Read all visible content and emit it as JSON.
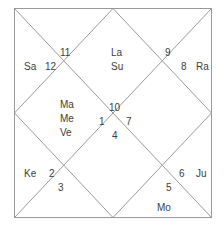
{
  "chart": {
    "type": "north-indian-vedic-birth-chart",
    "frame": {
      "border_color": "#9a9a9a",
      "line_color": "#9a9a9a",
      "background": "#ffffff",
      "text_color": "#3c3c3c",
      "x": 14,
      "y": 8,
      "width": 198,
      "height": 210
    },
    "houses": [
      {
        "number": "1",
        "x": 100,
        "y": 117,
        "planets": [
          "Ma",
          "Me",
          "Ve"
        ]
      },
      {
        "number": "2",
        "x": 47,
        "y": 170,
        "planets": [
          "Ke"
        ]
      },
      {
        "number": "3",
        "x": 58,
        "y": 184,
        "planets": []
      },
      {
        "number": "4",
        "x": 112,
        "y": 131,
        "planets": []
      },
      {
        "number": "5",
        "x": 166,
        "y": 183,
        "planets": [
          "Mo"
        ]
      },
      {
        "number": "6",
        "x": 178,
        "y": 169,
        "planets": [
          "Ju"
        ]
      },
      {
        "number": "7",
        "x": 126,
        "y": 117,
        "planets": []
      },
      {
        "number": "8",
        "x": 178,
        "y": 62,
        "planets": [
          "Ra"
        ]
      },
      {
        "number": "9",
        "x": 164,
        "y": 49,
        "planets": []
      },
      {
        "number": "10",
        "x": 112,
        "y": 102,
        "planets": []
      },
      {
        "number": "11",
        "x": 60,
        "y": 48,
        "planets": []
      },
      {
        "number": "12",
        "x": 45,
        "y": 62,
        "planets": [
          "Sa"
        ]
      }
    ],
    "labels": [
      {
        "name": "house-12-planet-sa",
        "text": "Sa",
        "x": 24,
        "y": 62,
        "kind": "planet"
      },
      {
        "name": "house-12-number",
        "text": "12",
        "x": 45,
        "y": 62,
        "kind": "house-num"
      },
      {
        "name": "house-11-number",
        "text": "11",
        "x": 60,
        "y": 48,
        "kind": "house-num"
      },
      {
        "name": "house-1-lagna",
        "text": "La",
        "x": 111,
        "y": 48,
        "kind": "planet"
      },
      {
        "name": "house-1-planet-su",
        "text": "Su",
        "x": 111,
        "y": 62,
        "kind": "planet"
      },
      {
        "name": "house-9-number",
        "text": "9",
        "x": 165,
        "y": 48,
        "kind": "house-num"
      },
      {
        "name": "house-8-number",
        "text": "8",
        "x": 181,
        "y": 62,
        "kind": "house-num"
      },
      {
        "name": "house-8-planet-ra",
        "text": "Ra",
        "x": 196,
        "y": 62,
        "kind": "planet"
      },
      {
        "name": "house-1-planet-ma",
        "text": "Ma",
        "x": 60,
        "y": 100,
        "kind": "planet"
      },
      {
        "name": "house-1-planet-me",
        "text": "Me",
        "x": 60,
        "y": 114,
        "kind": "planet"
      },
      {
        "name": "house-1-planet-ve",
        "text": "Ve",
        "x": 60,
        "y": 128,
        "kind": "planet"
      },
      {
        "name": "house-10-number",
        "text": "10",
        "x": 109,
        "y": 103,
        "kind": "house-num"
      },
      {
        "name": "house-1-number",
        "text": "1",
        "x": 99,
        "y": 117,
        "kind": "house-num"
      },
      {
        "name": "house-7-number",
        "text": "7",
        "x": 126,
        "y": 117,
        "kind": "house-num"
      },
      {
        "name": "house-4-number",
        "text": "4",
        "x": 112,
        "y": 131,
        "kind": "house-num"
      },
      {
        "name": "house-2-planet-ke",
        "text": "Ke",
        "x": 24,
        "y": 169,
        "kind": "planet"
      },
      {
        "name": "house-2-number",
        "text": "2",
        "x": 49,
        "y": 169,
        "kind": "house-num"
      },
      {
        "name": "house-3-number",
        "text": "3",
        "x": 58,
        "y": 183,
        "kind": "house-num"
      },
      {
        "name": "house-6-number",
        "text": "6",
        "x": 179,
        "y": 169,
        "kind": "house-num"
      },
      {
        "name": "house-6-planet-ju",
        "text": "Ju",
        "x": 196,
        "y": 169,
        "kind": "planet"
      },
      {
        "name": "house-5-number",
        "text": "5",
        "x": 166,
        "y": 183,
        "kind": "house-num"
      },
      {
        "name": "house-5-planet-mo",
        "text": "Mo",
        "x": 157,
        "y": 203,
        "kind": "planet"
      }
    ]
  }
}
